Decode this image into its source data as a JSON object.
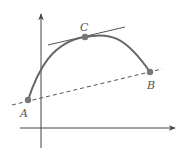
{
  "diagram": {
    "colors": {
      "curve": "#666666",
      "axes": "#444444",
      "points": "#777777",
      "labels": "#555555"
    },
    "points": [
      {
        "id": "A",
        "label": "A",
        "x": 28,
        "y": 100,
        "label_x": 20,
        "label_y": 117
      },
      {
        "id": "C",
        "label": "C",
        "x": 85,
        "y": 37,
        "label_x": 80,
        "label_y": 31
      },
      {
        "id": "B",
        "label": "B",
        "x": 150,
        "y": 72,
        "label_x": 147,
        "label_y": 89
      }
    ],
    "tangent_line": {
      "x1": 48,
      "y1": 45,
      "x2": 125,
      "y2": 27,
      "style": "solid"
    },
    "secant_line": {
      "x1": 12,
      "y1": 105,
      "x2": 162,
      "y2": 69,
      "style": "dashed"
    },
    "x_axis": {
      "x1": 20,
      "y1": 128,
      "x2": 175,
      "y2": 128
    },
    "y_axis": {
      "x1": 41,
      "y1": 148,
      "x2": 41,
      "y2": 14
    }
  }
}
